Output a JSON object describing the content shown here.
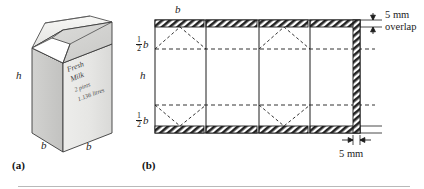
{
  "figure": {
    "background_color": "#ffffff",
    "ink_color": "#1c1c1c",
    "panels": [
      {
        "tag": "(a)",
        "name": "milk-carton-pictorial"
      },
      {
        "tag": "(b)",
        "name": "carton-net-development"
      }
    ]
  },
  "carton": {
    "brand_line_1": "Fresh",
    "brand_line_2": "Milk",
    "volume_imperial": "2 pints",
    "volume_metric": "1.136 litres",
    "dimension_height": "h",
    "dimension_width_left": "b",
    "dimension_width_right": "b",
    "face_fill": "#e8e8e6",
    "side_fill": "#cfcfcd",
    "top_fill": "#f4f4f2",
    "gable_fill": "#dcdcda"
  },
  "net": {
    "top_label": "b",
    "left_labels": {
      "upper_flap": {
        "numerator": "1",
        "denominator": "2",
        "symbol": "b"
      },
      "body": "h",
      "lower_flap": {
        "numerator": "1",
        "denominator": "2",
        "symbol": "b"
      }
    },
    "overlap_note_line_1": "5 mm",
    "overlap_note_line_2": "overlap",
    "side_overlap_note": "5 mm",
    "panel_count": 4,
    "fold_line_style": "dashed",
    "tab_style": "hatched"
  }
}
